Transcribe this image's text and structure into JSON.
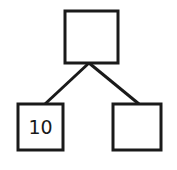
{
  "diagram": {
    "type": "tree",
    "stroke_color": "#1a1a1a",
    "background": "#ffffff",
    "nodes": [
      {
        "id": "root",
        "label": "",
        "x": 65,
        "y": 11,
        "w": 53,
        "h": 52
      },
      {
        "id": "left-child",
        "label": "10",
        "x": 18,
        "y": 104,
        "w": 45,
        "h": 46
      },
      {
        "id": "right-child",
        "label": "",
        "x": 113,
        "y": 104,
        "w": 48,
        "h": 46
      }
    ],
    "edges": [
      {
        "from": "root",
        "to": "left-child"
      },
      {
        "from": "root",
        "to": "right-child"
      }
    ]
  }
}
